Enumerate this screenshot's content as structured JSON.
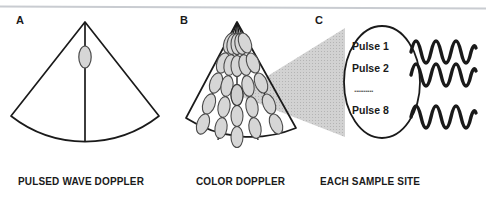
{
  "figure": {
    "background_color": "#ffffff",
    "top_rule_color": "#c9ccd1",
    "line_color": "#1a1a1a",
    "gate_fill_color": "#d6d6d6",
    "cone_fill_color": "#cccccc"
  },
  "panels": [
    {
      "letter": "A",
      "caption": "PULSED WAVE DOPPLER",
      "sample_gate_count": 1,
      "scan_line_count": 1
    },
    {
      "letter": "B",
      "caption": "COLOR DOPPLER",
      "sample_gate_count": 33,
      "scan_line_count": 5
    },
    {
      "letter": "C",
      "caption": "EACH SAMPLE SITE",
      "pulses": [
        "Pulse 1",
        "Pulse 2",
        "Pulse 8"
      ],
      "ellipsis": "..........",
      "waveform_count": 3,
      "waveform_cycles": 4
    }
  ]
}
